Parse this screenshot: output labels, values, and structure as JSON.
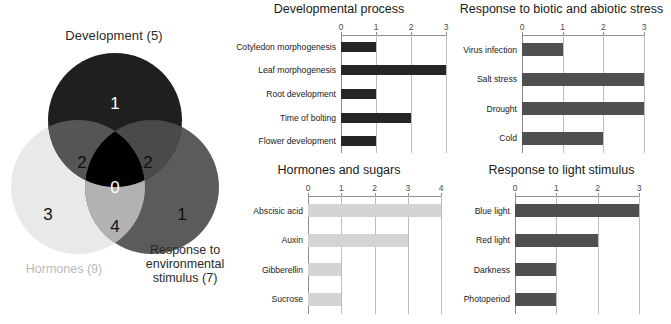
{
  "venn": {
    "title_top": "Development (5)",
    "label_left": "Hormones (9)",
    "label_right_lines": [
      "Response to",
      "environmental",
      "stimulus (7)"
    ],
    "label_right_full": "Response to environmental stimulus (7)",
    "regions": [
      {
        "name": "development-only",
        "value": "1"
      },
      {
        "name": "development-hormones",
        "value": "2"
      },
      {
        "name": "development-environment",
        "value": "2"
      },
      {
        "name": "center-all-three",
        "value": "0"
      },
      {
        "name": "hormones-only",
        "value": "3"
      },
      {
        "name": "hormones-environment",
        "value": "4"
      },
      {
        "name": "environment-only",
        "value": "1"
      }
    ],
    "colors": {
      "development": "#1f1f1f",
      "hormones": "#e9e9e9",
      "environment": "#5b5b5b",
      "dev_hormones": "#555555",
      "dev_environment": "#4a4a4a",
      "horm_environment": "#b2b2b2",
      "center": "#000000",
      "center_text": "#ffffff",
      "hormones_label": "#b9b9b9"
    }
  },
  "chart_data": [
    {
      "name": "developmental-process",
      "type": "bar",
      "orientation": "horizontal",
      "title": "Developmental process",
      "categories": [
        "Cotyledon morphogenesis",
        "Leaf morphogenesis",
        "Root development",
        "Time of bolting",
        "Flower development"
      ],
      "values": [
        1,
        3,
        1,
        2,
        1
      ],
      "ticks": [
        0,
        1,
        2,
        3
      ],
      "xlim": [
        0,
        3
      ],
      "xlabel": "",
      "ylabel": "",
      "grid": true,
      "bar_color": "#252525",
      "legend": "none"
    },
    {
      "name": "response-to-biotic-and-abiotic-stress",
      "type": "bar",
      "orientation": "horizontal",
      "title": "Response to biotic and abiotic stress",
      "categories": [
        "Virus infection",
        "Salt stress",
        "Drought",
        "Cold"
      ],
      "values": [
        1,
        3,
        3,
        2
      ],
      "ticks": [
        0,
        1,
        2,
        3
      ],
      "xlim": [
        0,
        3
      ],
      "xlabel": "",
      "ylabel": "",
      "grid": true,
      "bar_color": "#4f4f4f",
      "legend": "none"
    },
    {
      "name": "hormones-and-sugars",
      "type": "bar",
      "orientation": "horizontal",
      "title": "Hormones and sugars",
      "categories": [
        "Abscisic acid",
        "Auxin",
        "Gibberellin",
        "Sucrose"
      ],
      "values": [
        4,
        3,
        1,
        1
      ],
      "ticks": [
        0,
        1,
        2,
        3,
        4
      ],
      "xlim": [
        0,
        4
      ],
      "xlabel": "",
      "ylabel": "",
      "grid": true,
      "bar_color": "#d4d4d4",
      "legend": "none"
    },
    {
      "name": "response-to-light-stimulus",
      "type": "bar",
      "orientation": "horizontal",
      "title": "Response to light stimulus",
      "categories": [
        "Blue light",
        "Red light",
        "Darkness",
        "Photoperiod"
      ],
      "values": [
        3,
        2,
        1,
        1
      ],
      "ticks": [
        0,
        1,
        2,
        3
      ],
      "xlim": [
        0,
        3
      ],
      "xlabel": "",
      "ylabel": "",
      "grid": true,
      "bar_color": "#4f4f4f",
      "legend": "none"
    }
  ]
}
